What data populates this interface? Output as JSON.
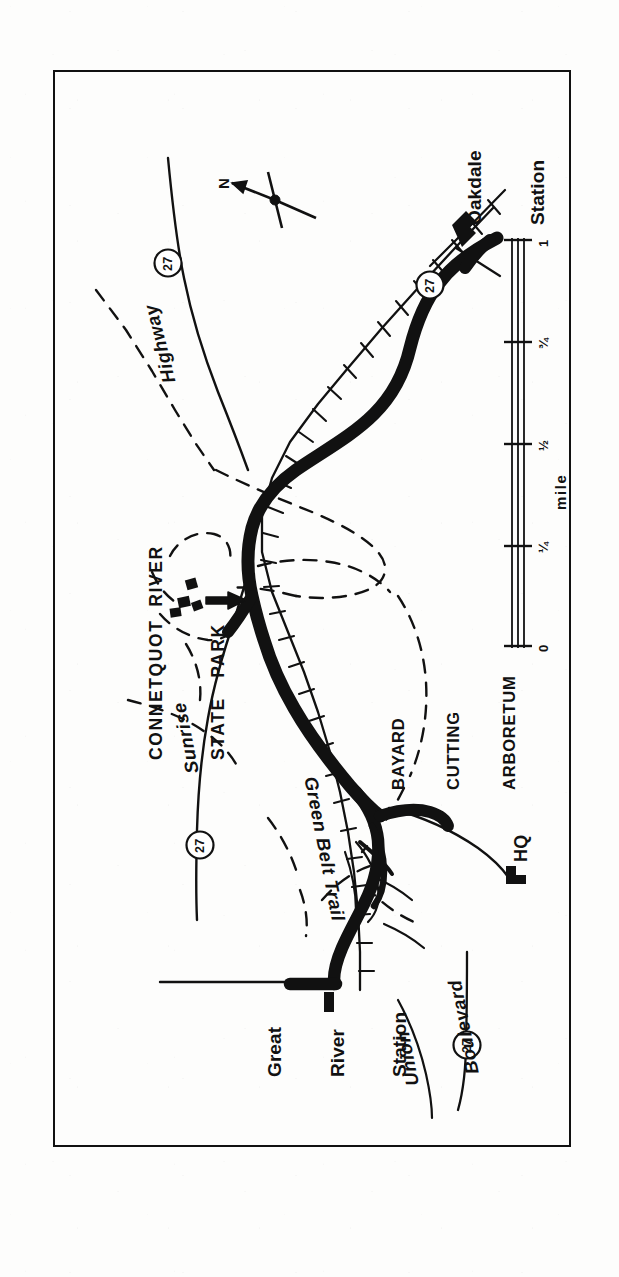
{
  "document": {
    "type": "scanned-map",
    "orientation": "rotated-90-ccw",
    "background_color": "#ffffff",
    "ink_color": "#111111"
  },
  "map": {
    "frame": {
      "border_color": "#111111"
    },
    "area_labels": [
      {
        "id": "park",
        "lines": [
          "CONNETQUOT  RIVER",
          "STATE   PARK"
        ],
        "line1": "CONNETQUOT  RIVER",
        "line2": "STATE   PARK"
      },
      {
        "id": "arboretum",
        "lines": [
          "BAYARD",
          "CUTTING",
          "ARBORETUM"
        ],
        "line1": "BAYARD",
        "line2": "CUTTING",
        "line3": "ARBORETUM"
      }
    ],
    "park_name_line1": "CONNETQUOT  RIVER",
    "park_name_line2": "STATE   PARK",
    "arboretum_line1": "BAYARD",
    "arboretum_line2": "CUTTING",
    "arboretum_line3": "ARBORETUM",
    "stations": [
      {
        "id": "oakdale",
        "line1": "Oakdale",
        "line2": "Station"
      },
      {
        "id": "great-river",
        "line1": "Great",
        "line2": "River",
        "line3": "Station"
      }
    ],
    "oakdale_line1": "Oakdale",
    "oakdale_line2": "Station",
    "great_river_line1": "Great",
    "great_river_line2": "River",
    "great_river_line3": "Station",
    "roads": [
      {
        "id": "highway",
        "label": "Highway",
        "style": "italic"
      },
      {
        "id": "sunrise",
        "label": "Sunrise",
        "style": "italic"
      },
      {
        "id": "union-boulevard-line1",
        "label": "Union",
        "style": "italic"
      },
      {
        "id": "union-boulevard-line2",
        "label": "Boulevard",
        "style": "italic"
      }
    ],
    "highway_label": "Highway",
    "sunrise_label": "Sunrise",
    "union_label_line1": "Union",
    "union_label_line2": "Boulevard",
    "trail_label": "Green Belt Trail",
    "hq_label": "HQ",
    "route_shields": [
      {
        "id": "shield-north",
        "number": "27"
      },
      {
        "id": "shield-oakdale",
        "number": "27"
      },
      {
        "id": "shield-sunrise",
        "number": "27"
      },
      {
        "id": "shield-south",
        "number": "27"
      }
    ],
    "route_number": "27",
    "compass": {
      "north_letter": "N"
    },
    "scale_bar": {
      "units_label": "mile",
      "ticks": [
        "0",
        "¼",
        "½",
        "¾",
        "1"
      ],
      "tick_0": "0",
      "tick_quarter": "¼",
      "tick_half": "½",
      "tick_three_quarter": "¾",
      "tick_one": "1"
    },
    "legend_symbols": [
      {
        "id": "railroad",
        "name": "railroad-hatched-line"
      },
      {
        "id": "park-boundary",
        "name": "dashed-boundary-line"
      },
      {
        "id": "main-road",
        "name": "thick-solid-road"
      },
      {
        "id": "building",
        "name": "black-building-block"
      },
      {
        "id": "entrance-arrow",
        "name": "park-entrance-arrow"
      }
    ]
  }
}
